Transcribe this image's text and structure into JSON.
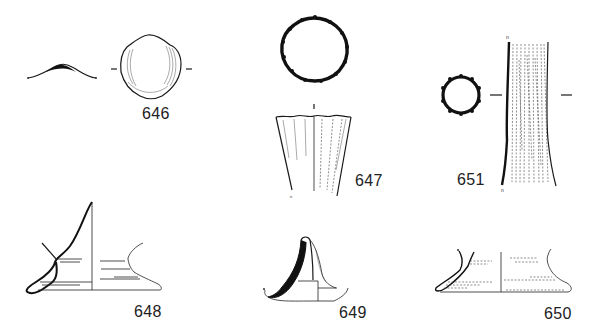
{
  "plate": {
    "title": "Catalogue drawings plate",
    "background_color": "#ffffff",
    "ink_color": "#1a1a1a"
  },
  "figures": [
    {
      "id": "646",
      "label": "646",
      "description": "shell-shaped fragment, plan view with profile section"
    },
    {
      "id": "647",
      "label": "647",
      "description": "ribbed beaker, plan of rim and side elevation"
    },
    {
      "id": "651",
      "label": "651",
      "description": "ribbed tube/stem, section and elevation with fine vertical ribbing"
    },
    {
      "id": "648",
      "label": "648",
      "description": "conical base with pushed-in foot ring, half section"
    },
    {
      "id": "649",
      "label": "649",
      "description": "small flask neck/base, thick-walled half section"
    },
    {
      "id": "650",
      "label": "650",
      "description": "low base with folded foot ring, half section"
    }
  ]
}
